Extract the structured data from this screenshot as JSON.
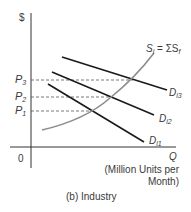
{
  "diagram": {
    "caption": "(b) Industry",
    "y_axis_label": "$",
    "x_axis_label": "Q",
    "x_axis_unit_line1": "(Million Units per",
    "x_axis_unit_line2": "Month)",
    "origin_label": "0",
    "price_levels": [
      {
        "name": "P",
        "sub": "3"
      },
      {
        "name": "P",
        "sub": "2"
      },
      {
        "name": "P",
        "sub": "1"
      }
    ],
    "supply_label": {
      "main": "S",
      "sub": "i",
      "eq": " = ΣS",
      "sub2": "f"
    },
    "demand_curves": [
      {
        "name": "D",
        "sub": "i3"
      },
      {
        "name": "D",
        "sub": "i2"
      },
      {
        "name": "D",
        "sub": "i1"
      }
    ],
    "colors": {
      "axis": "#333333",
      "demand": "#1a1a1a",
      "supply": "#8c8c8c",
      "dashed": "#555555"
    }
  }
}
